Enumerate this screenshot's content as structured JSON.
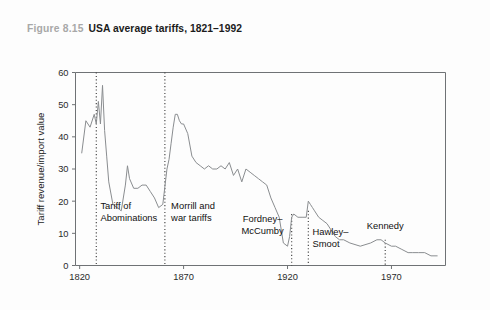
{
  "caption": {
    "figure_number": "Figure 8.15",
    "title": "USA average tariffs, 1821–1992"
  },
  "chart_data": {
    "type": "line",
    "title": "USA average tariffs, 1821–1992",
    "subtitle": "",
    "xlabel": "",
    "ylabel": "Tariff revenue/import value",
    "xlim": [
      1818,
      1996
    ],
    "ylim": [
      0,
      60
    ],
    "xticks": [
      1820,
      1870,
      1920,
      1970
    ],
    "xtick_labels": [
      "1820",
      "1870",
      "1920",
      "1970"
    ],
    "yticks": [
      0,
      10,
      20,
      30,
      40,
      50,
      60
    ],
    "ytick_labels": [
      "0",
      "10",
      "20",
      "30",
      "40",
      "50",
      "60"
    ],
    "grid": false,
    "legend": "none",
    "line_color": "#8a8d90",
    "series": [
      {
        "name": "Tariff revenue/import value",
        "x": [
          1821,
          1823,
          1825,
          1827,
          1828,
          1829,
          1830,
          1831,
          1832,
          1833,
          1834,
          1836,
          1838,
          1840,
          1842,
          1843,
          1844,
          1846,
          1848,
          1850,
          1852,
          1854,
          1856,
          1858,
          1860,
          1862,
          1863,
          1864,
          1865,
          1866,
          1867,
          1868,
          1869,
          1870,
          1872,
          1874,
          1876,
          1878,
          1880,
          1882,
          1884,
          1886,
          1888,
          1890,
          1892,
          1894,
          1896,
          1898,
          1900,
          1902,
          1904,
          1906,
          1908,
          1910,
          1912,
          1914,
          1916,
          1918,
          1920,
          1921,
          1922,
          1923,
          1925,
          1927,
          1929,
          1930,
          1931,
          1932,
          1933,
          1934,
          1935,
          1937,
          1939,
          1941,
          1943,
          1945,
          1947,
          1950,
          1955,
          1960,
          1963,
          1965,
          1967,
          1970,
          1972,
          1975,
          1978,
          1980,
          1983,
          1986,
          1989,
          1992
        ],
        "y": [
          35,
          45,
          43,
          47,
          44,
          51,
          44,
          56,
          42,
          34,
          26,
          19,
          18,
          17,
          25,
          31,
          27,
          24,
          24,
          25,
          25,
          23,
          21,
          18,
          19,
          30,
          33,
          38,
          43,
          47,
          47,
          45,
          44,
          44,
          41,
          34,
          32,
          31,
          30,
          31,
          30,
          30,
          31,
          30,
          32,
          28,
          30,
          26,
          30,
          29,
          28,
          27,
          26,
          25,
          21,
          18,
          15,
          7,
          6,
          9,
          15,
          16,
          15,
          15,
          15,
          20,
          19,
          18,
          17,
          16,
          15,
          14,
          13,
          11,
          9,
          8,
          8,
          7,
          6,
          7,
          8,
          8,
          7,
          6,
          6,
          5,
          4,
          4,
          4,
          4,
          3,
          3
        ]
      }
    ],
    "annotations": [
      {
        "name": "tariff-of-abominations",
        "lines": [
          "Tariff of",
          "Abominations"
        ],
        "x": 1828,
        "align": "left",
        "label_x": 1830,
        "label_y": 17.5,
        "guide_top": 60,
        "guide_bottom": 0
      },
      {
        "name": "morrill-and-war-tariffs",
        "lines": [
          "Morrill and",
          "war tariffs"
        ],
        "x": 1861,
        "align": "left",
        "label_x": 1864,
        "label_y": 17.5,
        "guide_top": 60,
        "guide_bottom": 0
      },
      {
        "name": "fordney-mccumby",
        "lines": [
          "Fordney–",
          "McCumby"
        ],
        "x": 1922,
        "align": "mid",
        "label_x": 1908,
        "label_y": 13.5,
        "guide_top": 16,
        "guide_bottom": 0
      },
      {
        "name": "hawley-smoot",
        "lines": [
          "Hawley–",
          "Smoot"
        ],
        "x": 1930,
        "align": "left",
        "label_x": 1932,
        "label_y": 9.5,
        "guide_top": 17,
        "guide_bottom": 0
      },
      {
        "name": "kennedy",
        "lines": [
          "Kennedy"
        ],
        "x": 1967,
        "align": "mid",
        "label_x": 1967,
        "label_y": 11.5,
        "guide_top": 8,
        "guide_bottom": 0
      }
    ]
  }
}
